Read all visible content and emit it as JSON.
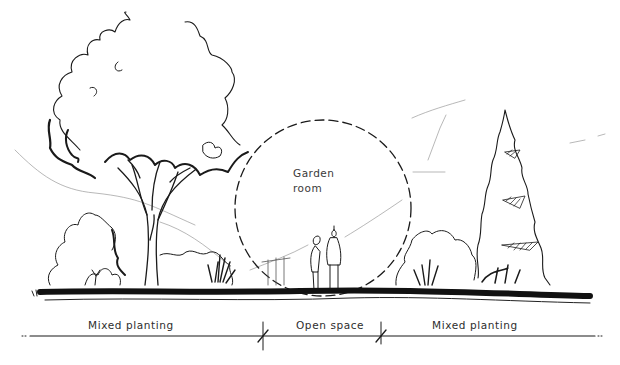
{
  "diagram": {
    "type": "landscape-section-sketch",
    "circle_label": {
      "line1": "Garden",
      "line2": "room"
    },
    "zones": [
      {
        "label": "Mixed planting",
        "position": "left"
      },
      {
        "label": "Open space",
        "position": "center"
      },
      {
        "label": "Mixed planting",
        "position": "right"
      }
    ],
    "elements": [
      "large-deciduous-tree",
      "shrub-mass-left",
      "garden-room-circle",
      "two-people",
      "shrub-mass-right",
      "conifer-tree",
      "ground-line",
      "dimension-line"
    ],
    "colors": {
      "ink": "#1a1a1a",
      "text": "#2e2e2e",
      "background": "#ffffff"
    }
  }
}
